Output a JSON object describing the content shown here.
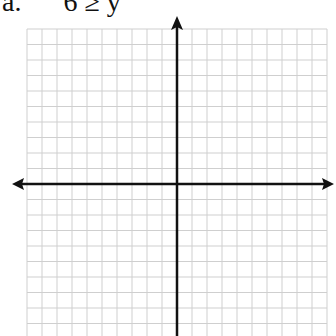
{
  "problem": {
    "label": "a.      6 ≥ y"
  },
  "graph": {
    "type": "coordinate-plane",
    "grid_origin_px": [
      177,
      184
    ],
    "grid_spacing_px": [
      15,
      15.5
    ],
    "grid_extent_px": {
      "left": 27,
      "right": 327,
      "top": 29,
      "bottom": 336
    },
    "colors": {
      "grid": "#cfcfcf",
      "axis": "#111111"
    }
  }
}
